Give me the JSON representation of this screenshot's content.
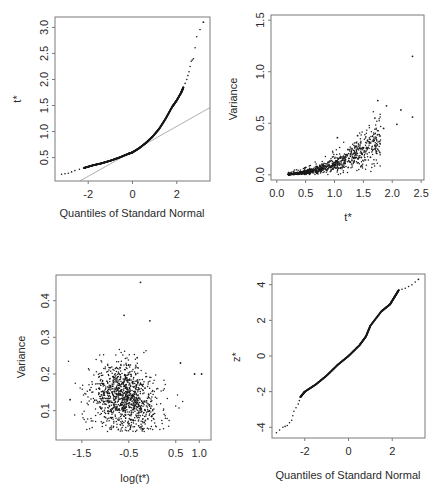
{
  "chart_data": [
    {
      "id": "qq_tstar",
      "type": "scatter",
      "subtype": "normal-qq",
      "title": "",
      "xlabel": "Quantiles of Standard Normal",
      "ylabel": "t*",
      "xlim": [
        -3.5,
        3.5
      ],
      "ylim": [
        0.05,
        3.2
      ],
      "xticks": [
        -2,
        0,
        2
      ],
      "yticks": [
        0.5,
        1.0,
        1.5,
        2.0,
        2.5,
        3.0
      ],
      "xtick_labels": [
        "-2",
        "0",
        "2"
      ],
      "ytick_labels": [
        "0.5",
        "1.0",
        "1.5",
        "2.0",
        "2.5",
        "3.0"
      ],
      "grid": false,
      "reference_line": {
        "intercept": 0.62,
        "slope": 0.24
      },
      "curve_points": [
        [
          -3.2,
          0.18
        ],
        [
          -2.9,
          0.2
        ],
        [
          -2.6,
          0.25
        ],
        [
          -2.2,
          0.3
        ],
        [
          -1.8,
          0.35
        ],
        [
          -1.4,
          0.39
        ],
        [
          -1.0,
          0.44
        ],
        [
          -0.6,
          0.5
        ],
        [
          -0.2,
          0.57
        ],
        [
          0.0,
          0.6
        ],
        [
          0.3,
          0.68
        ],
        [
          0.6,
          0.78
        ],
        [
          0.9,
          0.9
        ],
        [
          1.2,
          1.05
        ],
        [
          1.5,
          1.25
        ],
        [
          1.8,
          1.48
        ],
        [
          2.0,
          1.6
        ],
        [
          2.2,
          1.75
        ],
        [
          2.3,
          1.85
        ],
        [
          2.45,
          2.0
        ],
        [
          2.55,
          2.15
        ],
        [
          2.65,
          2.35
        ],
        [
          2.75,
          2.4
        ],
        [
          2.9,
          2.82
        ],
        [
          3.2,
          3.1
        ]
      ]
    },
    {
      "id": "var_vs_tstar",
      "type": "scatter",
      "title": "",
      "xlabel": "t*",
      "ylabel": "Variance",
      "xlim": [
        -0.1,
        2.55
      ],
      "ylim": [
        -0.05,
        1.55
      ],
      "xticks": [
        0.0,
        0.5,
        1.0,
        1.5,
        2.0,
        2.5
      ],
      "yticks": [
        0.0,
        0.5,
        1.0,
        1.5
      ],
      "xtick_labels": [
        "0.0",
        "0.5",
        "1.0",
        "1.5",
        "2.0",
        "2.5"
      ],
      "ytick_labels": [
        "0.0",
        "0.5",
        "1.0",
        "1.5"
      ],
      "grid": false,
      "outliers": [
        [
          2.35,
          1.15
        ],
        [
          1.75,
          0.72
        ],
        [
          1.9,
          0.67
        ],
        [
          2.15,
          0.63
        ],
        [
          1.7,
          0.55
        ],
        [
          2.35,
          0.56
        ],
        [
          1.85,
          0.45
        ],
        [
          2.08,
          0.49
        ],
        [
          1.4,
          0.38
        ],
        [
          1.05,
          0.36
        ]
      ],
      "description": "dense cloud of ~1000 points from t*=0.2 to 1.8, variance rising roughly quadratically from 0 to ~0.35"
    },
    {
      "id": "var_vs_logtstar",
      "type": "scatter",
      "title": "",
      "xlabel": "log(t*)",
      "ylabel": "Variance",
      "xlim": [
        -2.05,
        1.25
      ],
      "ylim": [
        0.02,
        0.47
      ],
      "xticks": [
        -1.5,
        -0.5,
        0.5,
        1.0
      ],
      "yticks": [
        0.1,
        0.2,
        0.3,
        0.4
      ],
      "xtick_labels": [
        "-1.5",
        "-0.5",
        "0.5",
        "1.0"
      ],
      "ytick_labels": [
        "0.1",
        "0.2",
        "0.3",
        "0.4"
      ],
      "grid": false,
      "outliers": [
        [
          -0.25,
          0.45
        ],
        [
          -0.6,
          0.36
        ],
        [
          -0.05,
          0.345
        ],
        [
          0.9,
          0.2
        ],
        [
          1.05,
          0.2
        ],
        [
          0.6,
          0.23
        ],
        [
          -1.75,
          0.13
        ]
      ],
      "description": "cloud centered around log(t*)=-0.6, variance 0.08-0.25"
    },
    {
      "id": "qq_zstar",
      "type": "scatter",
      "subtype": "normal-qq",
      "title": "",
      "xlabel": "Quantiles of Standard Normal",
      "ylabel": "z*",
      "xlim": [
        -3.5,
        3.5
      ],
      "ylim": [
        -4.6,
        4.6
      ],
      "xticks": [
        -2,
        0,
        2
      ],
      "yticks": [
        -4,
        -2,
        0,
        2,
        4
      ],
      "xtick_labels": [
        "-2",
        "0",
        "2"
      ],
      "ytick_labels": [
        "-4",
        "-2",
        "0",
        "2",
        "4"
      ],
      "grid": false,
      "curve_points": [
        [
          -3.3,
          -4.3
        ],
        [
          -3.0,
          -4.0
        ],
        [
          -2.8,
          -3.9
        ],
        [
          -2.6,
          -3.6
        ],
        [
          -2.5,
          -3.1
        ],
        [
          -2.3,
          -2.7
        ],
        [
          -2.2,
          -2.3
        ],
        [
          -2.0,
          -2.0
        ],
        [
          -1.5,
          -1.6
        ],
        [
          -1.0,
          -1.1
        ],
        [
          -0.5,
          -0.5
        ],
        [
          0.0,
          0.0
        ],
        [
          0.5,
          0.6
        ],
        [
          0.8,
          1.1
        ],
        [
          1.0,
          1.7
        ],
        [
          1.5,
          2.5
        ],
        [
          1.9,
          2.9
        ],
        [
          2.1,
          3.3
        ],
        [
          2.3,
          3.7
        ],
        [
          2.6,
          3.8
        ],
        [
          2.9,
          4.0
        ],
        [
          3.2,
          4.3
        ]
      ]
    }
  ]
}
